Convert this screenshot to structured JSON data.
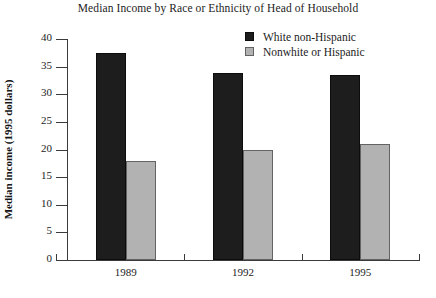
{
  "chart_data": {
    "type": "bar",
    "title": "Median Income by Race or Ethnicity of Head of Household",
    "xlabel": "",
    "ylabel": "Median income (1995 dollars)",
    "categories": [
      "1989",
      "1992",
      "1995"
    ],
    "series": [
      {
        "name": "White non-Hispanic",
        "color": "#1d1d1d",
        "values": [
          37.5,
          33.8,
          33.5
        ]
      },
      {
        "name": "Nonwhite or Hispanic",
        "color": "#b2b2b2",
        "values": [
          18.0,
          20.0,
          21.0
        ]
      }
    ],
    "ylim": [
      0,
      40
    ],
    "yticks": [
      "0",
      "5",
      "10",
      "15",
      "20",
      "25",
      "30",
      "35",
      "40"
    ],
    "ytick_values": [
      0,
      5,
      10,
      15,
      20,
      25,
      30,
      35,
      40
    ],
    "grid": false,
    "legend_position": "top-right"
  },
  "legend": {
    "items": [
      {
        "label": "White non-Hispanic"
      },
      {
        "label": "Nonwhite or Hispanic"
      }
    ]
  }
}
